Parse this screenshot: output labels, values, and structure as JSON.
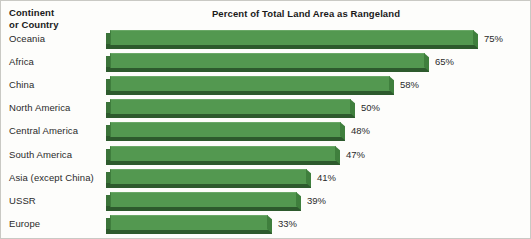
{
  "header": {
    "column_header_line1": "Continent",
    "column_header_line2": "or Country"
  },
  "chart_data": {
    "type": "bar",
    "orientation": "horizontal",
    "title": "Percent of Total Land Area as Rangeland",
    "xlabel": "",
    "ylabel": "Continent or Country",
    "xlim": [
      0,
      80
    ],
    "grid": false,
    "legend": null,
    "style": "3d-extruded-horizontal-bars",
    "categories": [
      "Oceania",
      "Africa",
      "China",
      "North America",
      "Central America",
      "South America",
      "Asia (except China)",
      "USSR",
      "Europe"
    ],
    "values": [
      75,
      65,
      58,
      50,
      48,
      47,
      41,
      39,
      33
    ],
    "data_labels": [
      "75%",
      "65%",
      "58%",
      "50%",
      "48%",
      "47%",
      "41%",
      "39%",
      "33%"
    ],
    "colors": {
      "bar_face": "#539850",
      "bar_shadow": "#2d5a2d",
      "bar_side": "#3b7339",
      "background": "#fdfdfb",
      "text": "#2a2a2a"
    }
  }
}
